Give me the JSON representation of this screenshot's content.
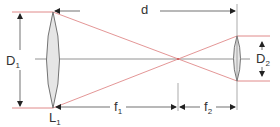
{
  "diagram": {
    "type": "beam-expander-optics",
    "colors": {
      "ray": "#e08a8a",
      "line": "#555555",
      "lens_fill": "#e6e6e6",
      "lens_stroke": "#666666"
    },
    "labels": {
      "distance": "d",
      "aperture1": {
        "main": "D",
        "sub": "1"
      },
      "aperture2": {
        "main": "D",
        "sub": "2"
      },
      "lens1": {
        "main": "L",
        "sub": "1"
      },
      "focal1": {
        "main": "f",
        "sub": "1"
      },
      "focal2": {
        "main": "f",
        "sub": "2"
      }
    }
  }
}
